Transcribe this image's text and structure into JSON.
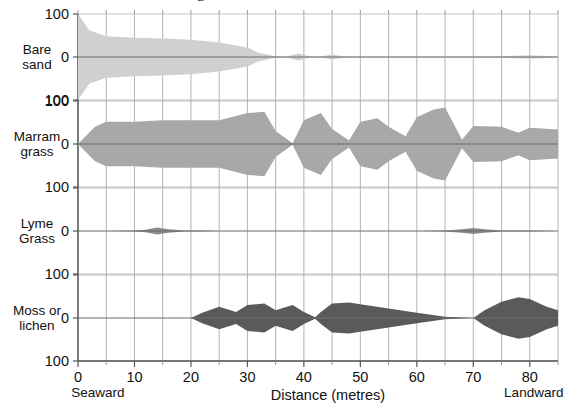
{
  "figure": {
    "cut_off_title_fragment": "g",
    "xlabel": "Distance (metres)",
    "seaward_label": "Seaward",
    "landward_label": "Landward"
  },
  "chart_data": {
    "type": "area",
    "chart_style": "kite-diagram",
    "title": "",
    "xlabel": "Distance (metres)",
    "ylabel": "",
    "xlim": [
      0,
      85
    ],
    "ylim": [
      -100,
      100
    ],
    "x_ticks": [
      0,
      10,
      20,
      30,
      40,
      50,
      60,
      70,
      80
    ],
    "x_tick_labels": [
      "0",
      "10",
      "20",
      "30",
      "40",
      "50",
      "60",
      "70",
      "80"
    ],
    "x_minor_tick_step": 5,
    "y_ticks": [
      100,
      0,
      100
    ],
    "y_tick_labels": [
      "100",
      "0",
      "100"
    ],
    "grid": true,
    "axis_end_annotations": {
      "left": "Seaward",
      "right": "Landward"
    },
    "legend_position": "none",
    "panel_colors": {
      "bare_sand": "#d0d0d0",
      "marram_grass": "#a8a8a8",
      "lyme_grass": "#8a8a8a",
      "moss_or_lichen": "#5a5a5a"
    },
    "panels": [
      {
        "name": "bare-sand",
        "label": "Bare\nsand",
        "label_line1": "Bare",
        "label_line2": "sand",
        "color": "#d0d0d0",
        "x": [
          0,
          2,
          5,
          10,
          15,
          20,
          25,
          30,
          32,
          35,
          37,
          39,
          41,
          43,
          45,
          47,
          50,
          55,
          60,
          65,
          70,
          75,
          80,
          85
        ],
        "values": [
          100,
          62,
          48,
          45,
          43,
          40,
          34,
          22,
          10,
          2,
          1,
          8,
          2,
          1,
          6,
          2,
          1,
          1,
          1,
          1,
          1,
          2,
          4,
          1
        ]
      },
      {
        "name": "marram-grass",
        "label": "Marram\ngrass",
        "label_line1": "Marram",
        "label_line2": "grass",
        "color": "#a8a8a8",
        "x": [
          0,
          3,
          5,
          10,
          15,
          20,
          25,
          30,
          33,
          35,
          38,
          40,
          43,
          45,
          48,
          50,
          53,
          55,
          58,
          60,
          63,
          65,
          68,
          70,
          75,
          78,
          80,
          85
        ],
        "values": [
          0,
          40,
          52,
          52,
          55,
          55,
          55,
          72,
          75,
          30,
          2,
          55,
          72,
          35,
          8,
          52,
          60,
          40,
          18,
          62,
          80,
          85,
          10,
          42,
          40,
          26,
          38,
          34
        ]
      },
      {
        "name": "lyme-grass",
        "label": "Lyme\nGrass",
        "label_line1": "Lyme",
        "label_line2": "Grass",
        "color": "#8a8a8a",
        "x": [
          0,
          5,
          10,
          12,
          14,
          16,
          19,
          22,
          25,
          30,
          40,
          50,
          60,
          65,
          68,
          70,
          72,
          75,
          80,
          85
        ],
        "values": [
          0,
          0,
          1,
          3,
          8,
          4,
          1,
          1,
          0,
          0,
          0,
          0,
          0,
          1,
          4,
          7,
          4,
          1,
          1,
          0
        ]
      },
      {
        "name": "moss-or-lichen",
        "label": "Moss or\nlichen",
        "label_line1": "Moss or",
        "label_line2": "lichen",
        "color": "#5a5a5a",
        "x": [
          0,
          10,
          20,
          22,
          25,
          28,
          30,
          33,
          35,
          38,
          40,
          42,
          43,
          45,
          48,
          50,
          55,
          60,
          65,
          68,
          70,
          72,
          75,
          78,
          80,
          83,
          85
        ],
        "values": [
          0,
          0,
          0,
          12,
          26,
          14,
          30,
          34,
          18,
          30,
          14,
          2,
          14,
          34,
          36,
          32,
          22,
          12,
          3,
          1,
          0,
          18,
          38,
          48,
          44,
          26,
          18
        ]
      }
    ]
  }
}
